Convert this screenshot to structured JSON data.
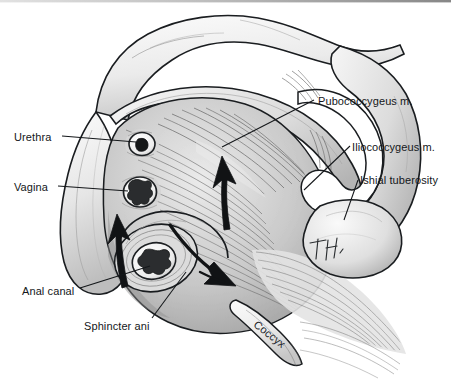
{
  "figure": {
    "style": "grayscale pen-and-ink medical illustration",
    "background_color": "#ffffff",
    "ink_color": "#14171a",
    "muscle_light": "#e8e8e8",
    "muscle_mid": "#b9b9b9",
    "muscle_dark": "#6f6f6f",
    "bone_light": "#f2f2f2",
    "bone_shadow": "#c9c9c9"
  },
  "labels": {
    "urethra": "Urethra",
    "vagina": "Vagina",
    "anal_canal": "Anal canal",
    "sphincter_ani": "Sphincter ani",
    "pubococcygeus": "Pubococcygeus m.",
    "iliococcygeus": "Iliococcygeus m.",
    "ischial_tuberosity": "Ishial tuberosity",
    "coccyx": "Coccyx"
  },
  "signature": {
    "monogram": "TH"
  },
  "structures": [
    {
      "name": "urethra",
      "kind": "orifice",
      "note": "small round opening, thick pale rim, dark lumen"
    },
    {
      "name": "vagina",
      "kind": "orifice",
      "note": "stellate slit, pale rim, dark irregular lumen"
    },
    {
      "name": "anal-canal",
      "kind": "orifice",
      "note": "stellate lumen within sphincter ring"
    },
    {
      "name": "sphincter-ani",
      "kind": "muscle",
      "note": "concentric ring encircling anal canal"
    },
    {
      "name": "pubococcygeus",
      "kind": "muscle",
      "note": "fibers running from pubis back toward coccyx"
    },
    {
      "name": "iliococcygeus",
      "kind": "muscle",
      "note": "broad fan lateral to pubococcygeus"
    },
    {
      "name": "ischial-tuberosity",
      "kind": "bone",
      "note": "rounded bony prominence, right lower"
    },
    {
      "name": "coccyx",
      "kind": "bone",
      "note": "tapered terminal bone, lower center-right"
    },
    {
      "name": "pubic-bone",
      "kind": "bone",
      "note": "anterior arch, upper left"
    },
    {
      "name": "obturator-foramen",
      "kind": "aperture",
      "note": "large oval opening in right hemipelvis"
    }
  ],
  "arrows": [
    {
      "name": "arrow-left-upward",
      "direction": "up",
      "note": "bold arrow lateral to anal canal"
    },
    {
      "name": "arrow-center-upward",
      "direction": "up",
      "note": "bold arrow over pubococcygeus"
    },
    {
      "name": "arrow-curved-sweep",
      "direction": "down-right",
      "note": "curved arrow sweeping toward coccyx"
    }
  ]
}
